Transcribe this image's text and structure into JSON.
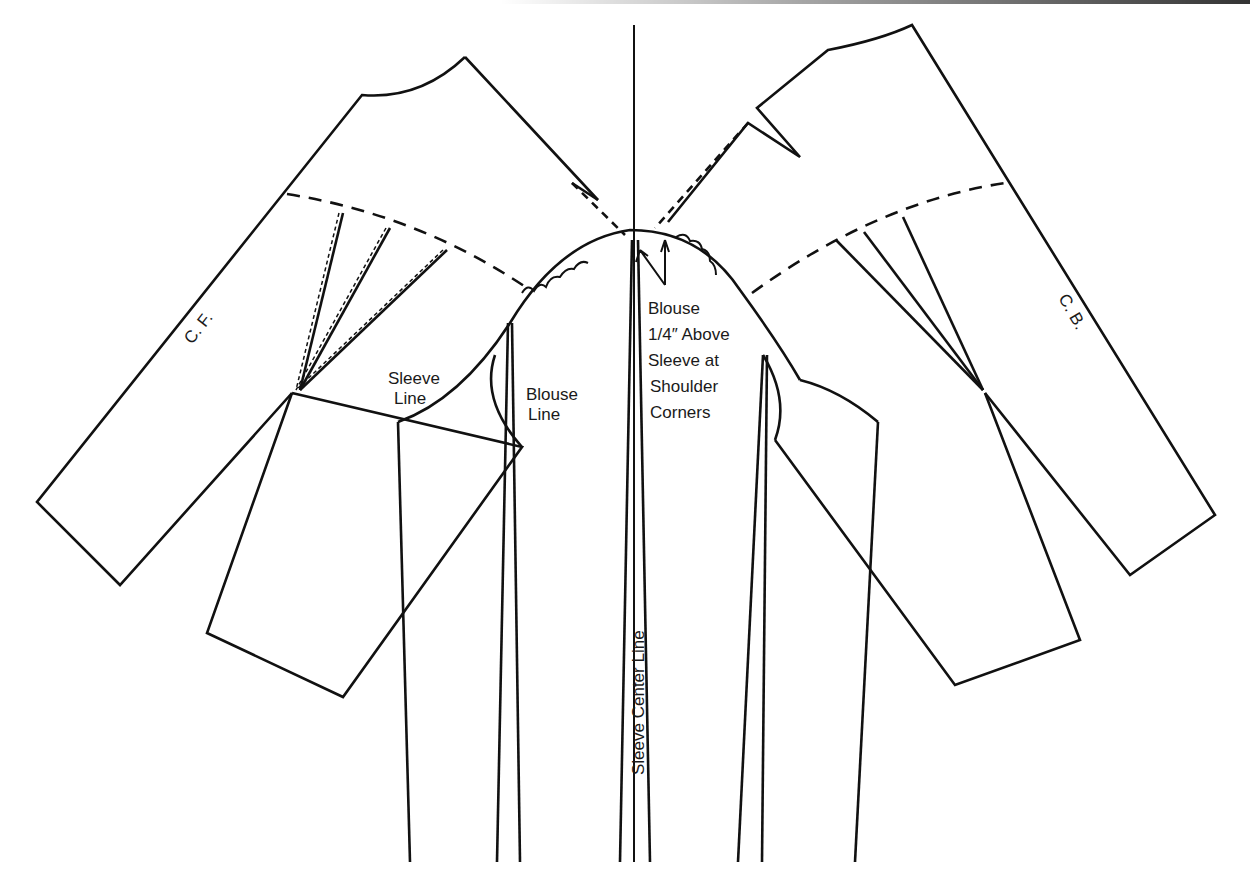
{
  "diagram": {
    "colors": {
      "line": "#111111",
      "background": "#ffffff",
      "text": "#1a1a1a"
    },
    "labels": {
      "center_front": "C. F.",
      "center_back": "C. B.",
      "sleeve_line": [
        "Sleeve",
        "Line"
      ],
      "blouse_line": [
        "Blouse",
        "Line"
      ],
      "annotation": [
        "Blouse",
        "1/4″ Above",
        "Sleeve at",
        "Shoulder",
        "Corners"
      ],
      "sleeve_center_line": "Sleeve   Center Line"
    },
    "parts": [
      {
        "id": "front-bodice",
        "label": "C. F."
      },
      {
        "id": "back-bodice",
        "label": "C. B."
      },
      {
        "id": "sleeve",
        "label": "Sleeve Center Line"
      }
    ]
  }
}
